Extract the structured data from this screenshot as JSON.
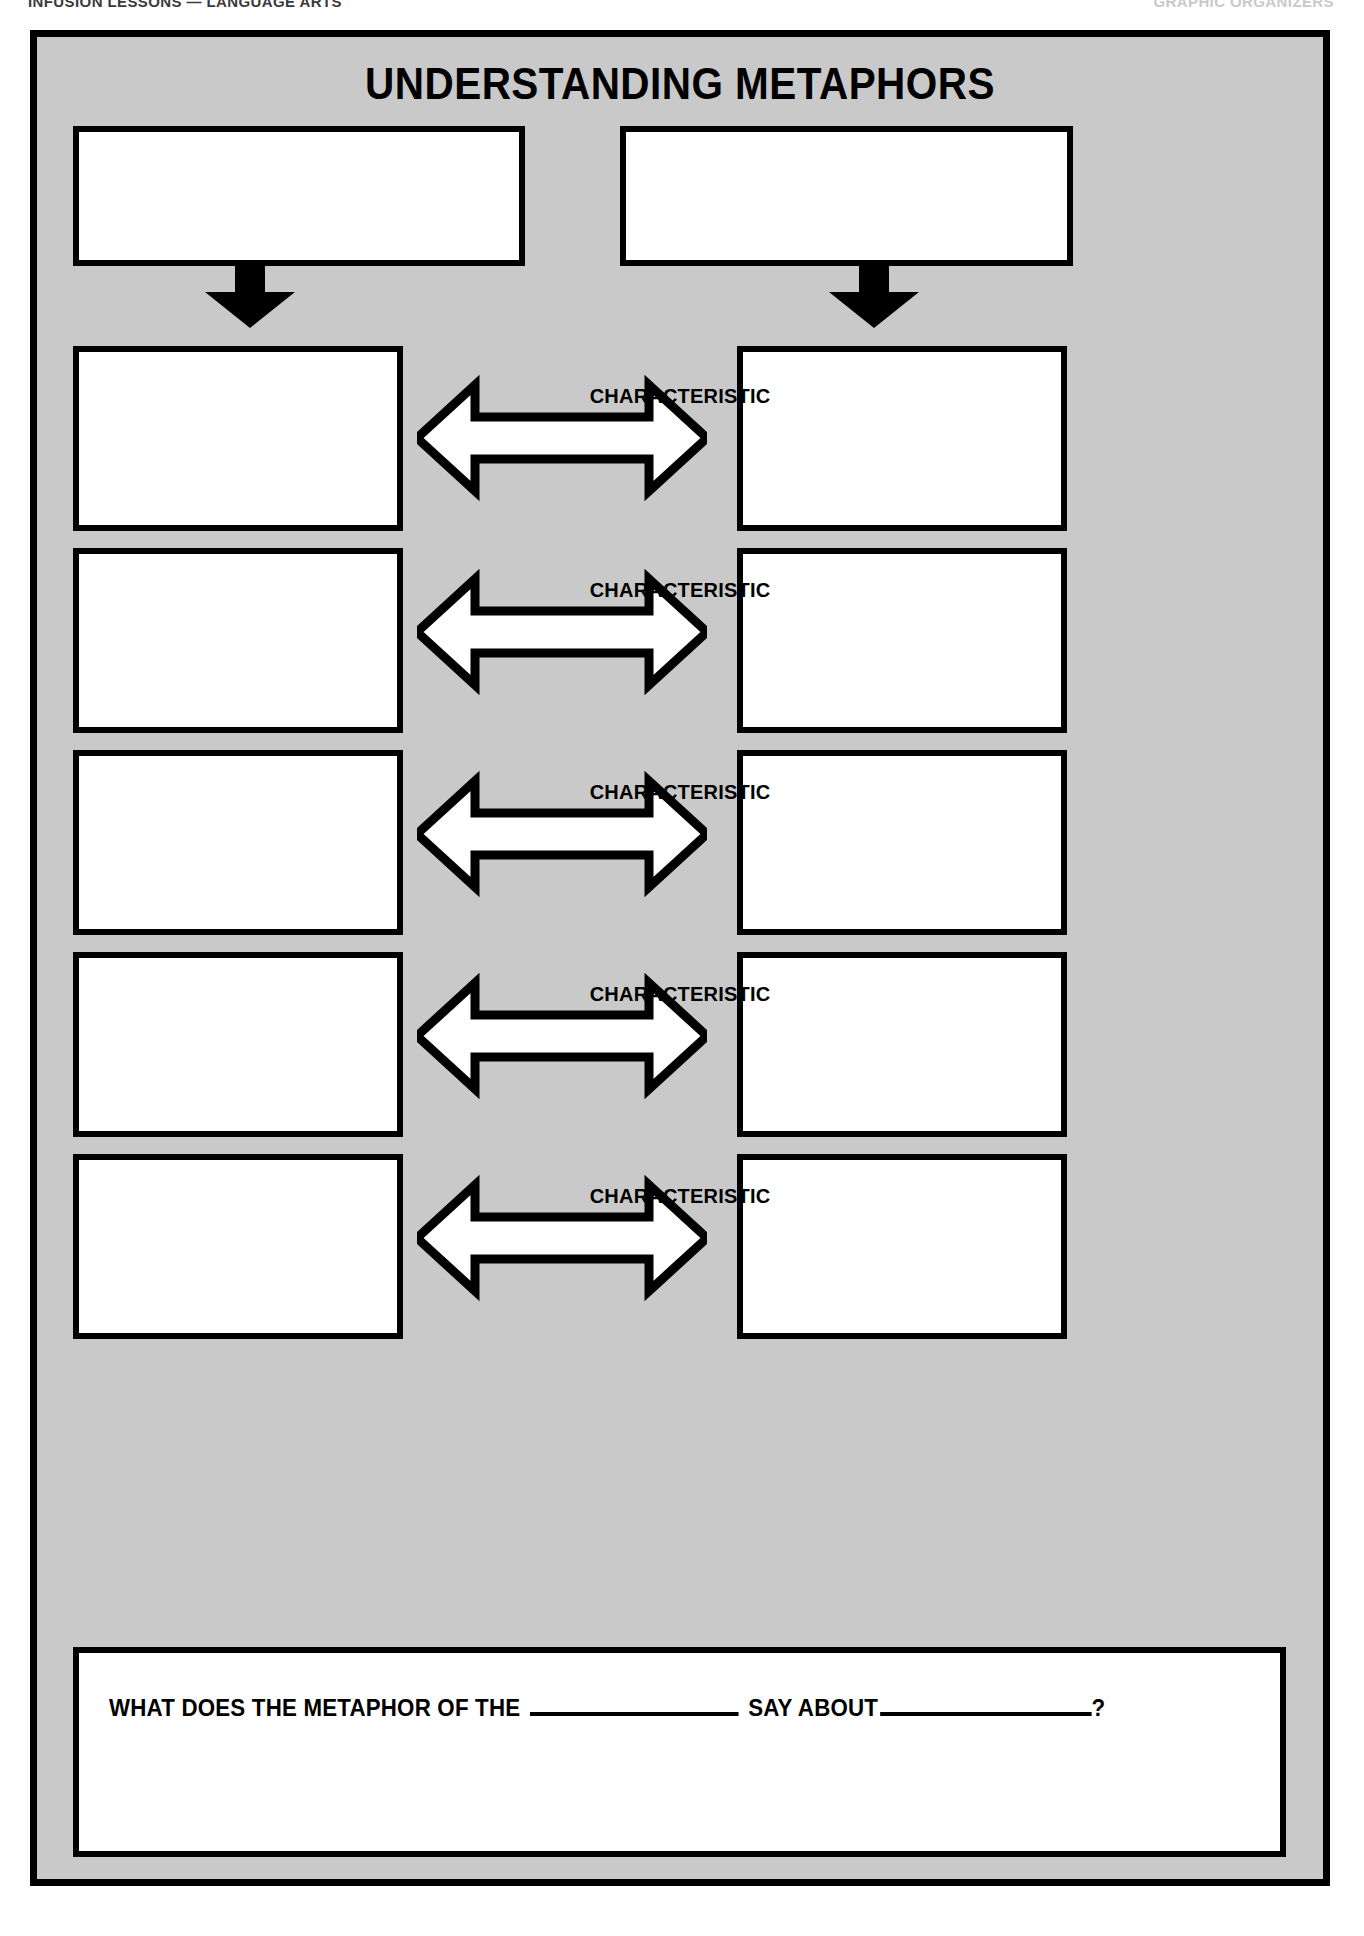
{
  "page": {
    "background": "#ffffff",
    "panel_background": "#c9c9c9",
    "ink_color": "#000000"
  },
  "running_header": {
    "left": "INFUSION LESSONS — LANGUAGE ARTS",
    "right": "GRAPHIC ORGANIZERS"
  },
  "worksheet": {
    "title": "UNDERSTANDING METAPHORS",
    "top_boxes": [
      {
        "label": "",
        "placeholder": ""
      },
      {
        "label": "",
        "placeholder": ""
      }
    ],
    "down_arrows": [
      {
        "name": "arrow-down-left",
        "direction": "down"
      },
      {
        "name": "arrow-down-right",
        "direction": "down"
      }
    ],
    "rows": [
      {
        "left_box": {
          "value": ""
        },
        "connector_label": "CHARACTERISTIC",
        "right_box": {
          "value": ""
        }
      },
      {
        "left_box": {
          "value": ""
        },
        "connector_label": "CHARACTERISTIC",
        "right_box": {
          "value": ""
        }
      },
      {
        "left_box": {
          "value": ""
        },
        "connector_label": "CHARACTERISTIC",
        "right_box": {
          "value": ""
        }
      },
      {
        "left_box": {
          "value": ""
        },
        "connector_label": "CHARACTERISTIC",
        "right_box": {
          "value": ""
        }
      },
      {
        "left_box": {
          "value": ""
        },
        "connector_label": "CHARACTERISTIC",
        "right_box": {
          "value": ""
        }
      }
    ],
    "question": {
      "part1": "WHAT DOES THE METAPHOR OF THE",
      "part2": "SAY  ABOUT",
      "part3": "?",
      "blank1_value": "",
      "blank2_value": ""
    }
  }
}
